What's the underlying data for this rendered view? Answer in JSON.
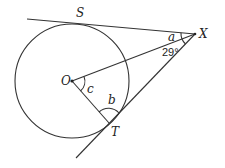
{
  "diagram": {
    "type": "circle-tangents",
    "points": {
      "O": {
        "label": "O",
        "x": 72,
        "y": 81
      },
      "S": {
        "label": "S",
        "x": 74,
        "y": 24
      },
      "X": {
        "label": "X",
        "x": 195,
        "y": 34
      },
      "T": {
        "label": "T",
        "x": 109,
        "y": 123
      }
    },
    "circle": {
      "center": "O",
      "radius": 57
    },
    "angles": {
      "a": {
        "label": "a"
      },
      "given": {
        "label": "29°"
      },
      "b": {
        "label": "b"
      },
      "c": {
        "label": "c"
      }
    },
    "colors": {
      "line": "#333333",
      "background": "#ffffff"
    }
  }
}
